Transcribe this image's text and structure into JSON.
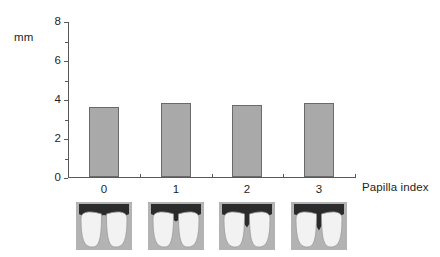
{
  "chart_data": {
    "type": "bar",
    "title": "",
    "subtitle": "",
    "xlabel": "Papilla index",
    "ylabel": "mm",
    "categories": [
      "0",
      "1",
      "2",
      "3"
    ],
    "values": [
      3.6,
      3.8,
      3.7,
      3.8
    ],
    "ylim": [
      0,
      8
    ],
    "yticks": [
      0,
      2,
      4,
      6,
      8
    ],
    "yminorticks": [
      1,
      3,
      5,
      7
    ],
    "grid": false,
    "legend": null,
    "bar_color": "#a9a9a9",
    "bar_edge_color": "#6a6a6a",
    "axis_color": "#585858",
    "series": [
      {
        "name": "Mean papilla height",
        "values": [
          3.6,
          3.8,
          3.7,
          3.8
        ]
      }
    ]
  },
  "axes": {
    "ylabel": "mm",
    "xlabel": "Papilla index",
    "ytick_labels": [
      "0",
      "2",
      "4",
      "6",
      "8"
    ],
    "xtick_labels": [
      "0",
      "1",
      "2",
      "3"
    ]
  },
  "illustrations": {
    "caption": "",
    "items": [
      {
        "index": "0",
        "name": "papilla-index-0-diagram",
        "description": "Interdental papilla completely fills the embrasure space",
        "recession_depth": 0.0
      },
      {
        "index": "1",
        "name": "papilla-index-1-diagram",
        "description": "Papilla slightly reduced, shallow dip between central incisors",
        "recession_depth": 0.33
      },
      {
        "index": "2",
        "name": "papilla-index-2-diagram",
        "description": "Papilla moderately reduced, V-shaped gap between teeth",
        "recession_depth": 0.62
      },
      {
        "index": "3",
        "name": "papilla-index-3-diagram",
        "description": "Papilla severely reduced, deep V-shaped gap between teeth",
        "recession_depth": 0.78
      }
    ],
    "colors": {
      "background": "#b3b3b3",
      "gingiva": "#2b2b2b",
      "tooth": "#f2f2f2",
      "tooth_outline": "#9a9a9a"
    }
  }
}
